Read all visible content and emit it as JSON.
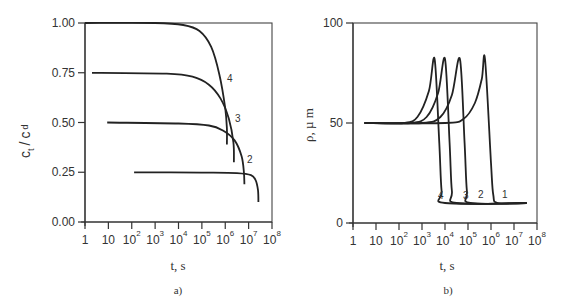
{
  "chart_data": [
    {
      "panel": "a)",
      "type": "line",
      "xlabel": "t, s",
      "ylabel": "c_t / c_d",
      "xscale": "log",
      "xlim": [
        1,
        100000000
      ],
      "ylim": [
        0.0,
        1.0
      ],
      "x_tick_labels": [
        "1",
        "10",
        "10^2",
        "10^3",
        "10^4",
        "10^5",
        "10^6",
        "10^7",
        "10^8"
      ],
      "y_tick_labels": [
        "0.00",
        "0.25",
        "0.50",
        "0.75",
        "1.00"
      ],
      "grid": false,
      "series": [
        {
          "name": "1",
          "points_log10t": [
            [
              2.1,
              0.25
            ],
            [
              5.0,
              0.248
            ],
            [
              6.5,
              0.245
            ],
            [
              7.1,
              0.235
            ],
            [
              7.3,
              0.21
            ],
            [
              7.4,
              0.16
            ],
            [
              7.42,
              0.1
            ]
          ]
        },
        {
          "name": "2",
          "points_log10t": [
            [
              0.95,
              0.5
            ],
            [
              4.0,
              0.495
            ],
            [
              5.3,
              0.485
            ],
            [
              5.9,
              0.46
            ],
            [
              6.4,
              0.41
            ],
            [
              6.7,
              0.33
            ],
            [
              6.8,
              0.25
            ],
            [
              6.82,
              0.19
            ]
          ]
        },
        {
          "name": "3",
          "points_log10t": [
            [
              0.3,
              0.75
            ],
            [
              3.5,
              0.745
            ],
            [
              4.6,
              0.73
            ],
            [
              5.3,
              0.69
            ],
            [
              5.8,
              0.62
            ],
            [
              6.15,
              0.52
            ],
            [
              6.35,
              0.4
            ],
            [
              6.37,
              0.3
            ]
          ]
        },
        {
          "name": "4",
          "points_log10t": [
            [
              0.0,
              1.0
            ],
            [
              3.0,
              1.0
            ],
            [
              4.2,
              0.99
            ],
            [
              4.9,
              0.96
            ],
            [
              5.4,
              0.88
            ],
            [
              5.75,
              0.74
            ],
            [
              6.0,
              0.57
            ],
            [
              6.07,
              0.47
            ],
            [
              6.07,
              0.39
            ]
          ]
        }
      ]
    },
    {
      "panel": "b)",
      "type": "line",
      "xlabel": "t, s",
      "ylabel": "ρ, µm",
      "xscale": "log",
      "xlim": [
        1,
        100000000
      ],
      "ylim": [
        0,
        100
      ],
      "x_tick_labels": [
        "1",
        "10",
        "10^2",
        "10^3",
        "10^4",
        "10^5",
        "10^6",
        "10^7",
        "10^8"
      ],
      "y_tick_labels": [
        "0",
        "50",
        "100"
      ],
      "grid": false,
      "series": [
        {
          "name": "1",
          "points_log10t": [
            [
              0.5,
              50
            ],
            [
              4.0,
              50
            ],
            [
              4.8,
              52
            ],
            [
              5.3,
              60
            ],
            [
              5.6,
              72
            ],
            [
              5.74,
              82
            ],
            [
              6.0,
              30
            ],
            [
              6.1,
              14
            ],
            [
              6.3,
              10
            ],
            [
              7.55,
              10
            ]
          ]
        },
        {
          "name": "2",
          "points_log10t": [
            [
              0.5,
              50
            ],
            [
              3.0,
              50
            ],
            [
              3.8,
              53
            ],
            [
              4.3,
              64
            ],
            [
              4.65,
              82
            ],
            [
              4.85,
              40
            ],
            [
              4.95,
              16
            ],
            [
              5.1,
              10
            ],
            [
              7.55,
              10
            ]
          ]
        },
        {
          "name": "3",
          "points_log10t": [
            [
              0.5,
              50
            ],
            [
              2.5,
              50
            ],
            [
              3.2,
              53
            ],
            [
              3.7,
              65
            ],
            [
              4.0,
              82
            ],
            [
              4.2,
              40
            ],
            [
              4.3,
              16
            ],
            [
              4.5,
              10
            ],
            [
              7.55,
              10
            ]
          ]
        },
        {
          "name": "4",
          "points_log10t": [
            [
              0.5,
              50
            ],
            [
              2.2,
              50
            ],
            [
              2.8,
              53
            ],
            [
              3.3,
              66
            ],
            [
              3.55,
              82
            ],
            [
              3.75,
              40
            ],
            [
              3.85,
              16
            ],
            [
              4.0,
              10
            ],
            [
              7.55,
              10
            ]
          ]
        }
      ]
    }
  ],
  "panels": {
    "a": {
      "caption": "a)",
      "xlabel": "t, s",
      "ylabel_main": "c",
      "ylabel_sub1": "t",
      "ylabel_sep": "/",
      "ylabel_main2": "c",
      "ylabel_sub2": "d",
      "y_ticks": [
        "1.00",
        "0.75",
        "0.50",
        "0.25",
        "0.00"
      ],
      "curve_labels": [
        "4",
        "3",
        "2"
      ]
    },
    "b": {
      "caption": "b)",
      "xlabel": "t, s",
      "ylabel": "ρ, µ m",
      "y_ticks": [
        "100",
        "50",
        "0"
      ],
      "curve_labels": [
        "4",
        "3",
        "2",
        "1"
      ]
    },
    "x_ticks": [
      {
        "base": "1",
        "exp": ""
      },
      {
        "base": "10",
        "exp": ""
      },
      {
        "base": "10",
        "exp": "2"
      },
      {
        "base": "10",
        "exp": "3"
      },
      {
        "base": "10",
        "exp": "4"
      },
      {
        "base": "10",
        "exp": "5"
      },
      {
        "base": "10",
        "exp": "6"
      },
      {
        "base": "10",
        "exp": "7"
      },
      {
        "base": "10",
        "exp": "8"
      }
    ]
  }
}
